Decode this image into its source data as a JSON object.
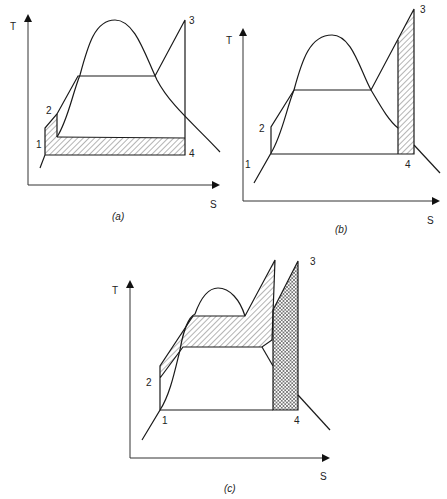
{
  "figure": {
    "type": "T-S diagrams of steam power cycles",
    "panels": [
      {
        "id": "a",
        "caption": "(a)",
        "axis_y_label": "T",
        "axis_x_label": "S",
        "points": [
          "1",
          "2",
          "3",
          "4"
        ],
        "shading": "hatched strip below cycle (between lines 1-4)"
      },
      {
        "id": "b",
        "caption": "(b)",
        "axis_y_label": "T",
        "axis_x_label": "S",
        "points": [
          "1",
          "2",
          "3",
          "4"
        ],
        "shading": "hatched vertical strip near 3-4"
      },
      {
        "id": "c",
        "caption": "(c)",
        "axis_y_label": "T",
        "axis_x_label": "S",
        "points": [
          "1",
          "2",
          "3",
          "4"
        ],
        "shading": "hatched band across dome plus cross-hatched vertical strip near 3-4"
      }
    ]
  },
  "labels": {
    "a": {
      "T": "T",
      "S": "S",
      "p1": "1",
      "p2": "2",
      "p3": "3",
      "p4": "4",
      "caption": "(a)"
    },
    "b": {
      "T": "T",
      "S": "S",
      "p1": "1",
      "p2": "2",
      "p3": "3",
      "p4": "4",
      "caption": "(b)"
    },
    "c": {
      "T": "T",
      "S": "S",
      "p1": "1",
      "p2": "2",
      "p3": "3",
      "p4": "4",
      "caption": "(c)"
    }
  }
}
